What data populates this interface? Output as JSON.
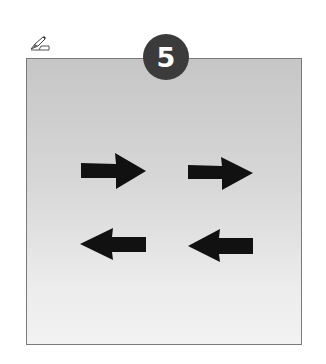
{
  "step": {
    "number": "5",
    "badge_color": "#3b3b3b",
    "text_color": "#ffffff"
  },
  "icons": {
    "note": "pencil-hand-icon"
  },
  "panel": {
    "gradient_top": "#c6c6c6",
    "gradient_bottom": "#f2f2f2",
    "border_color": "#7a7a7a"
  },
  "arrows": [
    {
      "direction": "right",
      "row": 1,
      "col": 1
    },
    {
      "direction": "right",
      "row": 1,
      "col": 2
    },
    {
      "direction": "left",
      "row": 2,
      "col": 1
    },
    {
      "direction": "left",
      "row": 2,
      "col": 2
    }
  ],
  "arrow_color": "#111111"
}
